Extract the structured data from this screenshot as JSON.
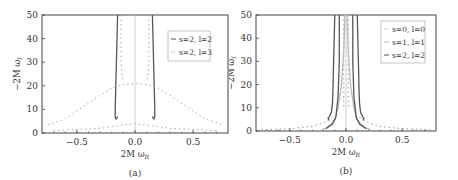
{
  "chart_data": [
    {
      "type": "line",
      "panel_label": "(a)",
      "xlabel": "2M ω_R",
      "ylabel": "−2M ω_I",
      "xlim": [
        -0.8,
        0.8
      ],
      "ylim": [
        0,
        50
      ],
      "xticks": [
        "-0.5",
        "0.0",
        "0.5"
      ],
      "yticks": [
        "0",
        "10",
        "20",
        "30",
        "40",
        "50"
      ],
      "grid": false,
      "legend_position": "upper right",
      "series": [
        {
          "name": "s=2, l=2",
          "style": "solid",
          "color": "#555555",
          "branches": [
            {
              "x": [
                -0.15,
                -0.155,
                -0.16,
                -0.165,
                -0.17,
                -0.17,
                -0.165,
                -0.16,
                -0.155,
                -0.15
              ],
              "y": [
                50,
                40,
                30,
                20,
                10,
                7,
                6,
                6,
                6.5,
                7
              ]
            },
            {
              "x": [
                0.15,
                0.155,
                0.16,
                0.165,
                0.17,
                0.17,
                0.165,
                0.16,
                0.155,
                0.15
              ],
              "y": [
                50,
                40,
                30,
                20,
                10,
                7,
                6,
                6,
                6.5,
                7
              ]
            }
          ],
          "points": [
            {
              "x": -0.17,
              "y": 10
            },
            {
              "x": -0.16,
              "y": 30
            },
            {
              "x": 0.16,
              "y": 30
            },
            {
              "x": 0.17,
              "y": 10
            }
          ]
        },
        {
          "name": "s=2, l=3",
          "style": "dashed",
          "color": "#aaaaaa",
          "branches": [
            {
              "x": [
                -0.75,
                -0.6,
                -0.45,
                -0.3,
                -0.2,
                -0.1,
                0.0,
                0.1,
                0.2,
                0.3,
                0.45,
                0.6,
                0.75
              ],
              "y": [
                3.5,
                6,
                11,
                16,
                19,
                20.5,
                21,
                20.5,
                19,
                16,
                11,
                6,
                3.5
              ]
            },
            {
              "x": [
                -0.12,
                -0.12,
                -0.11,
                -0.1
              ],
              "y": [
                50,
                30,
                24,
                22
              ]
            },
            {
              "x": [
                0.12,
                0.12,
                0.11,
                0.1
              ],
              "y": [
                50,
                30,
                24,
                22
              ]
            },
            {
              "x": [
                -0.7,
                -0.5,
                -0.3,
                -0.15,
                0.0,
                0.15,
                0.3,
                0.5,
                0.7
              ],
              "y": [
                1,
                1.5,
                2,
                3,
                4,
                3,
                2,
                1.5,
                1
              ]
            }
          ],
          "points": [
            {
              "x": -0.45,
              "y": 11
            },
            {
              "x": 0.0,
              "y": 21
            },
            {
              "x": 0.45,
              "y": 11
            }
          ]
        }
      ]
    },
    {
      "type": "line",
      "panel_label": "(b)",
      "xlabel": "2M ω_R",
      "ylabel": "−2M ω_I",
      "xlim": [
        -0.8,
        0.8
      ],
      "ylim": [
        0,
        50
      ],
      "xticks": [
        "-0.5",
        "0.0",
        "0.5"
      ],
      "yticks": [
        "0",
        "10",
        "20",
        "30",
        "40",
        "50"
      ],
      "grid": false,
      "legend_position": "upper right",
      "series": [
        {
          "name": "s=0, l=0",
          "style": "dashed",
          "color": "#999999",
          "branches": [
            {
              "x": [
                -0.75,
                -0.5,
                -0.3,
                -0.2,
                -0.15,
                -0.12
              ],
              "y": [
                0.5,
                1,
                2,
                3.5,
                5,
                6
              ]
            },
            {
              "x": [
                0.12,
                0.15,
                0.2,
                0.3,
                0.5,
                0.75
              ],
              "y": [
                6,
                5,
                3.5,
                2,
                1,
                0.5
              ]
            },
            {
              "x": [
                -0.02,
                -0.02
              ],
              "y": [
                50,
                10
              ]
            },
            {
              "x": [
                0.02,
                0.02
              ],
              "y": [
                50,
                10
              ]
            }
          ],
          "points": [
            {
              "x": -0.3,
              "y": 2
            },
            {
              "x": 0.3,
              "y": 2
            }
          ]
        },
        {
          "name": "s=1, l=1",
          "style": "solid",
          "color": "#bbbbbb",
          "branches": [
            {
              "x": [
                -0.01,
                -0.02,
                -0.04,
                -0.07,
                -0.1,
                -0.13,
                -0.17,
                -0.22
              ],
              "y": [
                50,
                35,
                20,
                10,
                5,
                3,
                1.5,
                0.5
              ]
            },
            {
              "x": [
                0.01,
                0.02,
                0.04,
                0.07,
                0.1,
                0.13,
                0.17,
                0.22
              ],
              "y": [
                50,
                35,
                20,
                10,
                5,
                3,
                1.5,
                0.5
              ]
            }
          ],
          "points": [
            {
              "x": -0.04,
              "y": 20
            },
            {
              "x": 0.04,
              "y": 20
            }
          ]
        },
        {
          "name": "s=2, l=2",
          "style": "solid",
          "color": "#555555",
          "branches": [
            {
              "x": [
                -0.1,
                -0.105,
                -0.11,
                -0.115,
                -0.12,
                -0.13,
                -0.15,
                -0.16,
                -0.15
              ],
              "y": [
                50,
                40,
                30,
                20,
                12,
                8,
                6,
                5.5,
                4.5
              ]
            },
            {
              "x": [
                0.1,
                0.105,
                0.11,
                0.115,
                0.12,
                0.13,
                0.15,
                0.16,
                0.15
              ],
              "y": [
                50,
                40,
                30,
                20,
                12,
                8,
                6,
                5.5,
                4.5
              ]
            },
            {
              "x": [
                -0.06,
                -0.06,
                -0.07,
                -0.09,
                -0.12,
                -0.18
              ],
              "y": [
                50,
                30,
                15,
                6,
                3,
                1
              ]
            },
            {
              "x": [
                0.06,
                0.06,
                0.07,
                0.09,
                0.12,
                0.18
              ],
              "y": [
                50,
                30,
                15,
                6,
                3,
                1
              ]
            }
          ],
          "points": [
            {
              "x": -0.12,
              "y": 12
            },
            {
              "x": 0.12,
              "y": 12
            }
          ]
        }
      ]
    }
  ],
  "panels": [
    {
      "label": "(a)",
      "xlabel_main": "2M ω",
      "xlabel_sub": "R",
      "ylabel_main": "−2M ω",
      "ylabel_sub": "I",
      "legend": [
        "s=2, l=2",
        "s=2, l=3"
      ],
      "xticks": [
        "−0.5",
        "0.0",
        "0.5"
      ],
      "yticks": [
        "0",
        "10",
        "20",
        "30",
        "40",
        "50"
      ]
    },
    {
      "label": "(b)",
      "xlabel_main": "2M ω",
      "xlabel_sub": "R",
      "ylabel_main": "−2M ω",
      "ylabel_sub": "I",
      "legend": [
        "s=0, l=0",
        "s=1, l=1",
        "s=2, l=2"
      ],
      "xticks": [
        "−0.5",
        "0.0",
        "0.5"
      ],
      "yticks": [
        "0",
        "10",
        "20",
        "30",
        "40",
        "50"
      ]
    }
  ]
}
